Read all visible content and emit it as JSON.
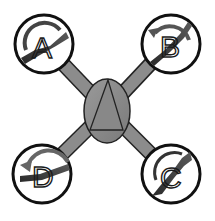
{
  "diagram": {
    "type": "quadcopter-rotor-layout",
    "center_body": {
      "shape": "ellipse",
      "marker": "triangle",
      "marker_meaning": "forward-direction"
    },
    "rotors": [
      {
        "id": "A",
        "label": "A",
        "position": "top-left",
        "rotation": "clockwise"
      },
      {
        "id": "B",
        "label": "B",
        "position": "top-right",
        "rotation": "counter-clockwise"
      },
      {
        "id": "C",
        "label": "C",
        "position": "bottom-right",
        "rotation": "clockwise"
      },
      {
        "id": "D",
        "label": "D",
        "position": "bottom-left",
        "rotation": "counter-clockwise"
      }
    ],
    "colors": {
      "arm": "#8c8c8c",
      "body": "#8a8a8a",
      "outline": "#111111",
      "propeller": "#3a3a3a",
      "arrow": "#4a4a4a",
      "background": "#ffffff"
    }
  }
}
